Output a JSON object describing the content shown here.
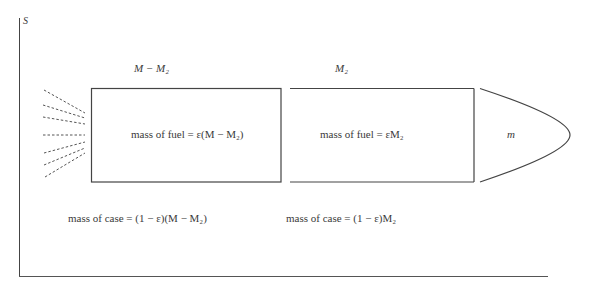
{
  "axis": {
    "label": "S"
  },
  "stage1": {
    "mass_label": "M − M₂",
    "fuel_label": "mass of fuel = ε(M − M₂)",
    "case_label": "mass of case = (1 − ε)(M − M₂)"
  },
  "stage2": {
    "mass_label": "M₂",
    "fuel_label": "mass of fuel = εM₂",
    "case_label": "mass of case = (1 − ε)M₂"
  },
  "payload": {
    "label": "m"
  },
  "colors": {
    "line": "#3a3a3a",
    "background": "#ffffff"
  }
}
